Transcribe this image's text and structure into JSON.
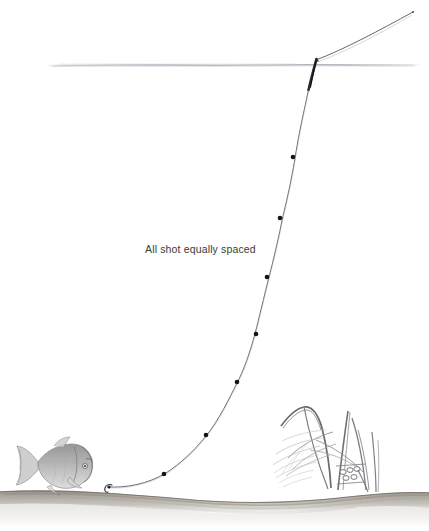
{
  "illustration": {
    "title": "Float fishing rig with shot pattern",
    "style": "pencil line drawing",
    "background_color": "#ffffff",
    "line_color": "#4a4a52",
    "shot_color": "#1a1a1a",
    "water_surface_color": "#b9bcc2",
    "riverbed_color": "#9a958e",
    "fish_color": "#8d8d8d",
    "reed_color": "#7c7c82"
  },
  "annotations": {
    "shot_spacing_note": "All shot equally spaced"
  },
  "labels": {
    "float": "float",
    "hook": "hook",
    "fish": "fish",
    "reeds": "reeds",
    "riverbed": "riverbed",
    "water_surface": "water surface",
    "rod_line": "line to rod tip"
  },
  "chart_data": {
    "type": "scatter",
    "title": "All shot equally spaced",
    "xlabel": "",
    "ylabel": "",
    "grid": false,
    "legend": "none",
    "xlim": [
      0,
      429
    ],
    "ylim": [
      531,
      0
    ],
    "series": [
      {
        "name": "split shot",
        "values": [
          [
            293,
            157
          ],
          [
            280,
            218
          ],
          [
            267,
            277
          ],
          [
            256,
            334
          ],
          [
            237,
            382
          ],
          [
            206,
            435
          ],
          [
            164,
            474
          ]
        ]
      },
      {
        "name": "main line",
        "path": [
          [
            316,
            60
          ],
          [
            308,
            90
          ],
          [
            297,
            140
          ],
          [
            288,
            186
          ],
          [
            276,
            238
          ],
          [
            265,
            288
          ],
          [
            252,
            345
          ],
          [
            232,
            392
          ],
          [
            205,
            437
          ],
          [
            170,
            470
          ],
          [
            130,
            484
          ],
          [
            108,
            487
          ]
        ]
      },
      {
        "name": "rod line above water",
        "path": [
          [
            316,
            60
          ],
          [
            350,
            45
          ],
          [
            385,
            27
          ],
          [
            413,
            12
          ]
        ]
      }
    ],
    "reference_lines": [
      {
        "name": "water surface",
        "y": 65,
        "x_start": 45,
        "x_end": 421
      }
    ]
  },
  "geometry": {
    "water_surface": {
      "y": 65,
      "x_start": 45,
      "x_end": 421
    },
    "float_tip": {
      "x": 316,
      "y": 60
    },
    "float_base": {
      "x": 308,
      "y": 90
    },
    "hook": {
      "x": 108,
      "y": 487
    },
    "rod_tip": {
      "x": 413,
      "y": 12
    },
    "shot_count": 7
  }
}
